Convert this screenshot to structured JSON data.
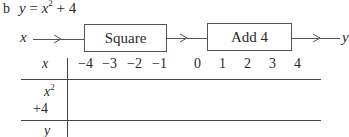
{
  "part_label": "b",
  "equation": {
    "lhs": "y",
    "eq": "=",
    "base": "x",
    "exponent": "2",
    "rest": "+ 4"
  },
  "flow": {
    "input": "x",
    "boxes": [
      {
        "label": "Square"
      },
      {
        "label": "Add 4"
      }
    ],
    "output": "y"
  },
  "table": {
    "header_label": "x",
    "x_values": [
      "−4",
      "−3",
      "−2",
      "−1",
      "0",
      "1",
      "2",
      "3",
      "4"
    ],
    "rows": [
      {
        "label_base": "x",
        "label_exp": "2",
        "cells": [
          "",
          "",
          "",
          "",
          "",
          "",
          "",
          "",
          ""
        ]
      },
      {
        "label": "+4",
        "cells": [
          "",
          "",
          "",
          "",
          "",
          "",
          "",
          "",
          ""
        ]
      },
      {
        "label": "y",
        "cells": [
          "",
          "",
          "",
          "",
          "",
          "",
          "",
          "",
          ""
        ]
      }
    ]
  },
  "colors": {
    "ink": "#2a2a2a",
    "lines": "#555555",
    "background": "#ffffff"
  }
}
